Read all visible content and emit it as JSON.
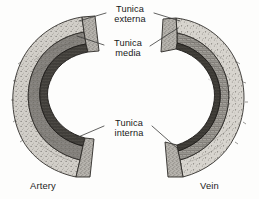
{
  "figure": {
    "title_present": false,
    "background_color": "#fdfdfc",
    "ink_color": "#171717",
    "width": 259,
    "height": 199
  },
  "labels": {
    "externa": {
      "line1": "Tunica",
      "line2": "externa"
    },
    "media": {
      "line1": "Tunica",
      "line2": "media"
    },
    "interna": {
      "line1": "Tunica",
      "line2": "interna"
    }
  },
  "captions": {
    "left": "Artery",
    "right": "Vein"
  },
  "specimens": [
    {
      "name": "artery",
      "caption": "Artery",
      "side": "left",
      "wall_thickness": "thick",
      "layers": [
        "tunica externa",
        "tunica media",
        "tunica interna"
      ]
    },
    {
      "name": "vein",
      "caption": "Vein",
      "side": "right",
      "wall_thickness": "thin",
      "layers": [
        "tunica externa",
        "tunica media",
        "tunica interna"
      ]
    }
  ],
  "colors": {
    "externa_fill": "#c9c6c0",
    "media_fill": "#8d8b86",
    "interna_fill": "#4a4845",
    "outline": "#2a2a28",
    "leader_line": "#3a3a38",
    "text": "#171717",
    "page": "#fdfdfc"
  }
}
